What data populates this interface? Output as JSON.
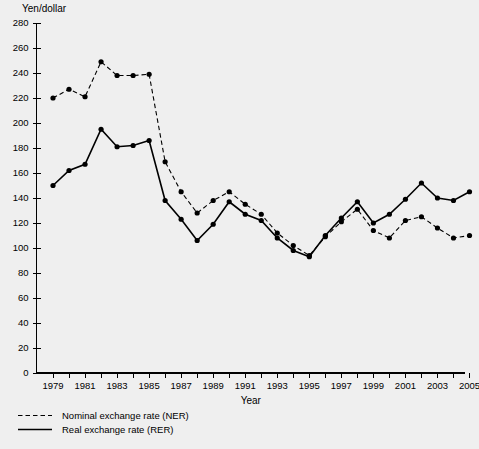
{
  "chart_data": {
    "type": "line",
    "title": "",
    "ylabel": "Yen/dollar",
    "xlabel": "Year",
    "ylim": [
      0,
      280
    ],
    "xlim": [
      1979,
      2005
    ],
    "y_ticks": [
      0,
      20,
      40,
      60,
      80,
      100,
      120,
      140,
      160,
      180,
      200,
      220,
      240,
      260,
      280
    ],
    "x_ticks": [
      1979,
      1980,
      1981,
      1982,
      1983,
      1984,
      1985,
      1986,
      1987,
      1988,
      1989,
      1990,
      1991,
      1992,
      1993,
      1994,
      1995,
      1996,
      1997,
      1998,
      1999,
      2000,
      2001,
      2002,
      2003,
      2004,
      2005
    ],
    "x_tick_labels": [
      "1979",
      "",
      "1981",
      "",
      "1983",
      "",
      "1985",
      "",
      "1987",
      "",
      "1989",
      "",
      "1991",
      "",
      "1993",
      "",
      "1995",
      "",
      "1997",
      "",
      "1999",
      "",
      "2001",
      "",
      "2003",
      "",
      "2005"
    ],
    "grid": false,
    "legend_position": "below-left",
    "categories": [
      1979,
      1980,
      1981,
      1982,
      1983,
      1984,
      1985,
      1986,
      1987,
      1988,
      1989,
      1990,
      1991,
      1992,
      1993,
      1994,
      1995,
      1996,
      1997,
      1998,
      1999,
      2000,
      2001,
      2002,
      2003,
      2004,
      2005
    ],
    "series": [
      {
        "name": "Nominal exchange rate (NER)",
        "style": "dashed",
        "marker": "filled-circle",
        "values": [
          220,
          227,
          221,
          249,
          238,
          238,
          239,
          169,
          145,
          128,
          138,
          145,
          135,
          127,
          112,
          102,
          94,
          109,
          121,
          131,
          114,
          108,
          122,
          125,
          116,
          108,
          110
        ]
      },
      {
        "name": "Real exchange rate (RER)",
        "style": "solid",
        "marker": "filled-circle",
        "values": [
          150,
          162,
          167,
          195,
          181,
          182,
          186,
          138,
          123,
          106,
          119,
          137,
          127,
          122,
          108,
          98,
          93,
          110,
          124,
          137,
          120,
          127,
          139,
          152,
          140,
          138,
          145
        ]
      }
    ],
    "legend": [
      {
        "label": "Nominal exchange rate (NER)",
        "style": "dashed"
      },
      {
        "label": "Real exchange rate (RER)",
        "style": "solid"
      }
    ]
  },
  "colors": {
    "background": "#efefef",
    "ink": "#000000"
  }
}
